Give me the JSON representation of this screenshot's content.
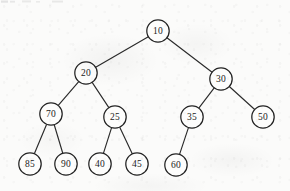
{
  "diagram": {
    "type": "binary-tree",
    "node_radius": 11.2,
    "colors": {
      "background": "#fbfbfa",
      "node_fill": "#fdfdfc",
      "node_stroke": "#232323",
      "edge_stroke": "#2b2b2b",
      "label_text": "#1a1a1a"
    },
    "nodes": [
      {
        "id": "n10",
        "label": "10",
        "x": 158,
        "y": 31,
        "level": 0
      },
      {
        "id": "n20",
        "label": "20",
        "x": 86,
        "y": 73,
        "level": 1
      },
      {
        "id": "n30",
        "label": "30",
        "x": 221,
        "y": 79,
        "level": 1
      },
      {
        "id": "n70",
        "label": "70",
        "x": 51,
        "y": 114,
        "level": 2
      },
      {
        "id": "n25",
        "label": "25",
        "x": 115,
        "y": 117,
        "level": 2
      },
      {
        "id": "n35",
        "label": "35",
        "x": 192,
        "y": 117,
        "level": 2
      },
      {
        "id": "n50",
        "label": "50",
        "x": 263,
        "y": 117,
        "level": 2
      },
      {
        "id": "n85",
        "label": "85",
        "x": 30,
        "y": 164,
        "level": 3
      },
      {
        "id": "n90",
        "label": "90",
        "x": 66,
        "y": 164,
        "level": 3
      },
      {
        "id": "n40",
        "label": "40",
        "x": 100,
        "y": 164,
        "level": 3
      },
      {
        "id": "n45",
        "label": "45",
        "x": 137,
        "y": 164,
        "level": 3
      },
      {
        "id": "n60",
        "label": "60",
        "x": 176,
        "y": 165,
        "level": 3
      }
    ],
    "edges": [
      {
        "from": "n10",
        "to": "n20",
        "side": "left"
      },
      {
        "from": "n10",
        "to": "n30",
        "side": "right"
      },
      {
        "from": "n20",
        "to": "n70",
        "side": "left"
      },
      {
        "from": "n20",
        "to": "n25",
        "side": "right"
      },
      {
        "from": "n30",
        "to": "n35",
        "side": "left"
      },
      {
        "from": "n30",
        "to": "n50",
        "side": "right"
      },
      {
        "from": "n70",
        "to": "n85",
        "side": "left"
      },
      {
        "from": "n70",
        "to": "n90",
        "side": "right"
      },
      {
        "from": "n25",
        "to": "n40",
        "side": "left"
      },
      {
        "from": "n25",
        "to": "n45",
        "side": "right"
      },
      {
        "from": "n35",
        "to": "n60",
        "side": "left"
      }
    ]
  }
}
